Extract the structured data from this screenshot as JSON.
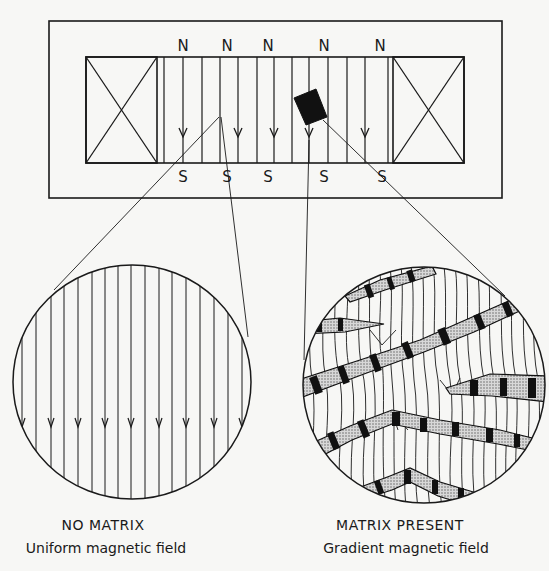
{
  "figure": {
    "colors": {
      "ink": "#1a1a1a",
      "paper": "#f7f7f5",
      "stipple": "#9a9a9a"
    },
    "magnet": {
      "north_labels": [
        "N",
        "N",
        "N",
        "N",
        "N"
      ],
      "south_labels": [
        "S",
        "S",
        "S",
        "S",
        "S"
      ],
      "coils": [
        "left-coil",
        "right-coil"
      ],
      "matrix_element": "black-rectangle"
    },
    "left_panel": {
      "title": "NO MATRIX",
      "subtitle": "Uniform magnetic field"
    },
    "right_panel": {
      "title": "MATRIX PRESENT",
      "subtitle": "Gradient magnetic field"
    }
  }
}
